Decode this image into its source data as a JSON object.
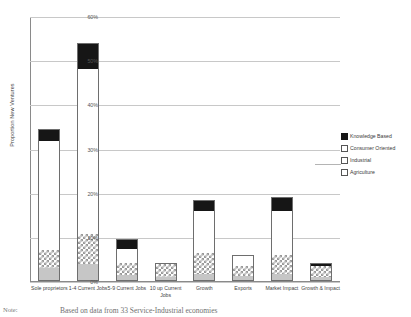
{
  "chart_data": {
    "type": "bar",
    "stacked": true,
    "title": "",
    "xlabel": "",
    "ylabel": "Proportion New Ventures",
    "ylim": [
      0,
      60
    ],
    "ytick_labels": [
      "60%",
      "50%",
      "40%",
      "30%",
      "20%",
      "10%",
      "0%"
    ],
    "ytick_values": [
      60,
      50,
      40,
      30,
      20,
      10,
      0
    ],
    "grid": true,
    "legend_position": "right",
    "categories": [
      "Sole proprietors",
      "1-4 Current Jobs",
      "5-9 Current Jobs",
      "10 up Current Jobs",
      "Growth",
      "Exports",
      "Market Impact",
      "Growth & Impact"
    ],
    "series": [
      {
        "name": "Agriculture",
        "values": [
          2.7,
          3.6,
          1.2,
          0.7,
          1.4,
          0.9,
          1.4,
          0.7
        ]
      },
      {
        "name": "Industrial",
        "values": [
          4.1,
          6.8,
          2.7,
          2.9,
          4.8,
          2.3,
          4.3,
          2.5
        ]
      },
      {
        "name": "Consumer Oriented",
        "values": [
          24.7,
          37.4,
          3.2,
          0.0,
          9.5,
          2.3,
          10.0,
          0.0
        ]
      },
      {
        "name": "Knowledge Based",
        "values": [
          2.5,
          5.7,
          1.9,
          0.0,
          2.3,
          0.0,
          2.8,
          0.4
        ]
      }
    ],
    "totals": [
      34.0,
      53.5,
      9.0,
      3.6,
      18.0,
      5.5,
      18.5,
      3.6
    ]
  },
  "legend": {
    "items": [
      {
        "label": "Knowledge Based",
        "key": "knowledge"
      },
      {
        "label": "Consumer Oriented",
        "key": "consumer"
      },
      {
        "label": "Industrial",
        "key": "industrial"
      },
      {
        "label": "Agriculture",
        "key": "agriculture"
      }
    ]
  },
  "xlabels": [
    "Sole proprietors",
    "1-4 Current Jobs",
    "5-9 Current Jobs",
    "10 up Current Jobs",
    "Growth",
    "Exports",
    "Market Impact",
    "Growth & Impact"
  ],
  "caption": {
    "note_label": "Note:",
    "text": "Based on data from 33 Service-Industrial economies"
  },
  "colors": {
    "knowledge": "#161616",
    "consumer": "#ffffff",
    "industrial": "#9a9a9a",
    "agriculture": "#c6c6c6",
    "grid": "#c8c8c8",
    "axis": "#8a8a8a"
  }
}
